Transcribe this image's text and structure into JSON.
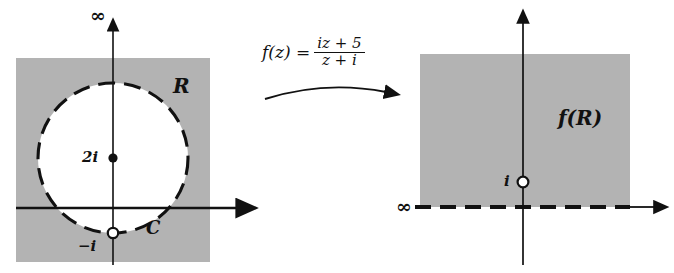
{
  "figure": {
    "background_color": "#ffffff",
    "ink_color": "#111111",
    "shade_color": "#b3b3b3"
  },
  "left_panel": {
    "region_label": "R",
    "curve_label": "C",
    "infinity_label": "∞",
    "center_point_label": "2i",
    "excluded_point_label": "−i",
    "shade_color": "#b3b3b3",
    "axes": {
      "vertical_axis_x": 113,
      "horizontal_axis_y": 208
    },
    "circle": {
      "center_x": 113,
      "center_y": 158,
      "radius": 75,
      "style": "dashed"
    },
    "points": [
      {
        "label": "2i",
        "x": 113,
        "y": 158,
        "marker": "filled"
      },
      {
        "label": "−i",
        "x": 113,
        "y": 233,
        "marker": "open"
      }
    ]
  },
  "map_arrow": {
    "formula_lhs": "f(z) =",
    "formula_numerator": "iz + 5",
    "formula_denominator": "z + i",
    "direction": "left-to-right"
  },
  "right_panel": {
    "region_label": "f(R)",
    "infinity_label": "∞",
    "point_label": "i",
    "shade_color": "#b3b3b3",
    "axes": {
      "vertical_axis_x": 523,
      "horizontal_axis_y": 207
    },
    "points": [
      {
        "label": "i",
        "x": 523,
        "y": 182,
        "marker": "open"
      }
    ],
    "boundary_style": "dashed"
  }
}
